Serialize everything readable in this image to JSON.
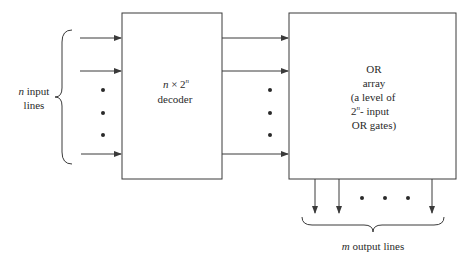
{
  "diagram": {
    "input_label": {
      "var": "n",
      "line1_rest": " input",
      "line2": "lines"
    },
    "decoder": {
      "line1_var": "n",
      "line1_times": " × 2",
      "line1_sup": "n",
      "line2": "decoder"
    },
    "or_array": {
      "line1": "OR",
      "line2": "array",
      "line3": "(a level of",
      "line4_base": "2",
      "line4_sup": "n",
      "line4_rest": "- input",
      "line5": "OR gates)"
    },
    "output_label": {
      "var": "m",
      "rest": " output lines"
    },
    "colors": {
      "stroke": "#3a3a3a",
      "text": "#2a2a2a",
      "background": "#ffffff"
    }
  }
}
